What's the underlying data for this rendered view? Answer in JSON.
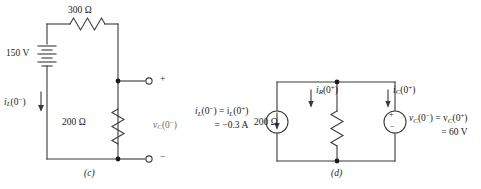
{
  "figure": {
    "panels": [
      {
        "id": "c",
        "caption": "(c)",
        "components": {
          "source_label": "150 V",
          "series_resistor": "300 Ω",
          "shunt_resistor": "200 Ω",
          "inductor_current_label_main": "i",
          "inductor_current_label_sub": "L",
          "inductor_current_label_arg": "(0",
          "inductor_current_label_sup": "−",
          "inductor_current_label_close": ")",
          "capacitor_voltage_label_main": "v",
          "capacitor_voltage_label_sub": "C",
          "capacitor_voltage_label_arg": "(0",
          "capacitor_voltage_label_sup": "−",
          "capacitor_voltage_label_close": ")",
          "terminal_plus": "+",
          "terminal_minus": "−"
        }
      },
      {
        "id": "d",
        "caption": "(d)",
        "components": {
          "shunt_resistor": "200 Ω",
          "source_current_line1_main": "i",
          "source_current_line1_sub": "L",
          "source_current_line1_a": "(0",
          "source_current_line1_sup1": "−",
          "source_current_line1_b": ") = i",
          "source_current_line1_sub2": "L",
          "source_current_line1_c": "(0",
          "source_current_line1_sup2": "+",
          "source_current_line1_d": ")",
          "source_current_line2": "= −0.3 A",
          "resistor_current_main": "i",
          "resistor_current_sub": "R",
          "resistor_current_a": "(0",
          "resistor_current_sup": "+",
          "resistor_current_b": ")",
          "cap_current_main": "i",
          "cap_current_sub": "C",
          "cap_current_a": "(0",
          "cap_current_sup": "+",
          "cap_current_b": ")",
          "cap_voltage_line1_main": "v",
          "cap_voltage_line1_sub": "C",
          "cap_voltage_line1_a": "(0",
          "cap_voltage_line1_sup1": "−",
          "cap_voltage_line1_b": ") = v",
          "cap_voltage_line1_sub2": "C",
          "cap_voltage_line1_c": "(0",
          "cap_voltage_line1_sup2": "+",
          "cap_voltage_line1_d": ")",
          "cap_voltage_line2": "= 60 V",
          "vsource_plus": "+",
          "vsource_minus": "−"
        }
      }
    ],
    "colors": {
      "wire": "#3a3a3a",
      "text": "#1a1a1a",
      "node": "#1a1a1a"
    }
  }
}
